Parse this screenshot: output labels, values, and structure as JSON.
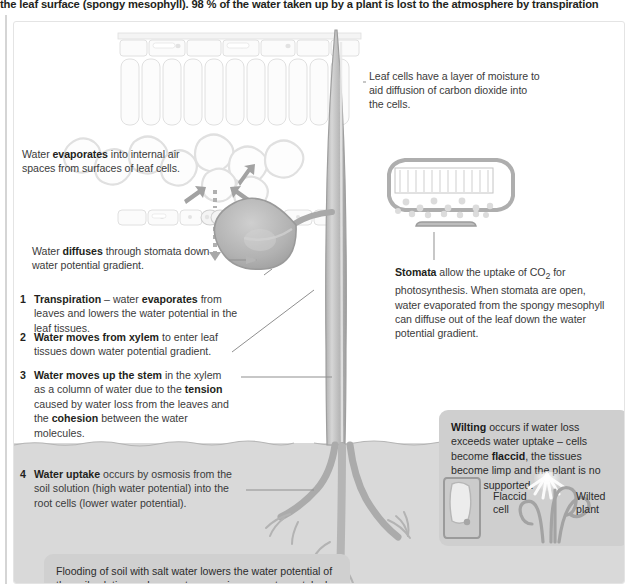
{
  "header": {
    "running_text": "the leaf surface (spongy mesophyll). 98 % of the water taken up by a plant is lost to the atmosphere by transpiration"
  },
  "annotations": {
    "evaporation": {
      "pre": "Water ",
      "bold": "evaporates",
      "post": " into internal air spaces from surfaces of leaf cells."
    },
    "diffusion": {
      "pre": "Water ",
      "bold": "diffuses",
      "post": " through stomata down water potential gradient."
    },
    "leaf_cells": {
      "text": "Leaf cells have a layer of moisture to aid diffusion of carbon dioxide into the cells."
    },
    "stomata": {
      "bold": "Stomata",
      "text_a": " allow the uptake of CO",
      "sub": "2",
      "text_b": " for photosynthesis. When stomata are open, water evaporated from the spongy mesophyll can diffuse out of the leaf down the water potential gradient."
    }
  },
  "steps": [
    {
      "number": "1",
      "bold_lead": "Transpiration",
      "mid_a": " – water ",
      "bold_mid": "evaporates",
      "mid_b": " from leaves and lowers the water potential in the leaf tissues."
    },
    {
      "number": "2",
      "bold_lead": "Water moves from xylem",
      "mid_a": " to enter leaf tissues down water potential gradient.",
      "bold_mid": "",
      "mid_b": ""
    },
    {
      "number": "3",
      "bold_lead": "Water moves up the stem",
      "mid_a": " in the xylem as a column of water due to the ",
      "bold_mid": "tension",
      "mid_b": " caused by water loss from the leaves and the ",
      "bold_mid2": "cohesion",
      "mid_c": " between the water molecules."
    },
    {
      "number": "4",
      "bold_lead": "Water uptake",
      "mid_a": " occurs by osmosis from the soil solution (high water potential) into the root cells (lower water potential).",
      "bold_mid": "",
      "mid_b": ""
    }
  ],
  "callouts": {
    "flooding": {
      "text": "Flooding of soil with salt water lowers the water potential of the soil solution and prevents osmosis – no water uptake by roots."
    },
    "wilting": {
      "bold_lead": "Wilting",
      "text_a": " occurs if water loss exceeds water uptake – cells become ",
      "bold_mid": "flaccid",
      "text_b": ", the tissues become limp and the plant is no longer supported.",
      "label_flaccid": "Flaccid cell",
      "label_wilted": "Wilted plant"
    }
  },
  "colors": {
    "soil": "#d9d9d9",
    "plant_gray": "#a8a8a8",
    "plant_fill": "#bcbcbc",
    "callout_gray": "#d0d0d0",
    "text": "#3b3b3b",
    "heading_text": "#231f20",
    "cell_outline": "#dcdcdc",
    "arrow_gray": "#9b9b9b"
  },
  "figure": {
    "leaf_section_label": "leaf-cross-section-top",
    "stoma_detail_label": "stoma-leaf-detail",
    "plant_label": "plant-stem-and-roots"
  }
}
